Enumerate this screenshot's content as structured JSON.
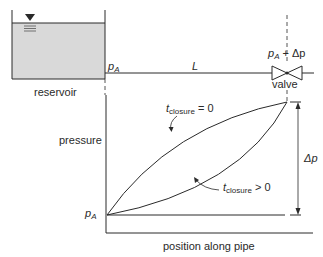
{
  "diagram": {
    "type": "water-hammer pressure along pipe",
    "reservoir": {
      "label": "reservoir",
      "fill_color": "#d9d9d9"
    },
    "pipe": {
      "inlet_pressure_label": "p",
      "inlet_pressure_sub": "A",
      "length_label": "L"
    },
    "valve": {
      "label": "valve",
      "pressure_label_p": "p",
      "pressure_label_sub": "A",
      "pressure_label_rest": " + Δp"
    },
    "plot": {
      "y_axis_label": "pressure",
      "x_axis_label": "position along pipe",
      "origin_label_p": "p",
      "origin_label_sub": "A",
      "delta_label": "Δp",
      "curves": [
        {
          "name": "instant-closure",
          "label_t": "t",
          "label_sub": "closure",
          "label_rest": " = 0"
        },
        {
          "name": "gradual-closure",
          "label_t": "t",
          "label_sub": "closure",
          "label_rest": " > 0"
        }
      ]
    },
    "colors": {
      "line": "#2a2a2a",
      "water": "#d9d9d9",
      "background": "#ffffff"
    }
  }
}
